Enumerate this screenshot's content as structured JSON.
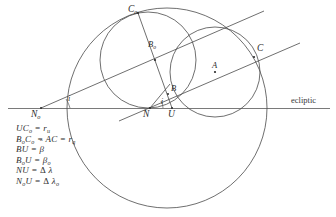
{
  "figure": {
    "type": "geometric-diagram",
    "background_color": "#ffffff",
    "stroke_color": "#3a3a3a"
  },
  "axis": {
    "ecliptic_label": "ecliptic"
  },
  "points": [
    {
      "key": "C_o",
      "text": "C",
      "sub": "o",
      "x": 138,
      "y": 13,
      "label_x": 128,
      "label_y": 6
    },
    {
      "key": "B_o",
      "text": "B",
      "sub": "o",
      "x": 155,
      "y": 50,
      "label_x": 149,
      "label_y": 41
    },
    {
      "key": "C",
      "text": "C",
      "sub": "",
      "x": 254,
      "y": 57,
      "label_x": 256,
      "label_y": 45
    },
    {
      "key": "A",
      "text": "A",
      "sub": "",
      "x": 215,
      "y": 72,
      "label_x": 213,
      "label_y": 62
    },
    {
      "key": "B",
      "text": "B",
      "sub": "",
      "x": 168,
      "y": 95,
      "label_x": 170,
      "label_y": 85
    },
    {
      "key": "N",
      "text": "N",
      "sub": "",
      "x": 150,
      "y": 108,
      "label_x": 144,
      "label_y": 110
    },
    {
      "key": "U",
      "text": "U",
      "sub": "",
      "x": 172,
      "y": 108,
      "label_x": 168,
      "label_y": 110
    },
    {
      "key": "N_o",
      "text": "N",
      "sub": "o",
      "x": 41,
      "y": 108,
      "label_x": 31,
      "label_y": 110
    }
  ],
  "angles": [
    {
      "key": "i-at-No",
      "text": "i",
      "label_x": 66,
      "label_y": 96
    },
    {
      "key": "i-at-N",
      "text": "i",
      "label_x": 162,
      "label_y": 98
    }
  ],
  "legend": {
    "equations": [
      {
        "id": "eq-1",
        "html": "UC<sub>o</sub> = r<sub>u</sub>"
      },
      {
        "id": "eq-2",
        "html": "B<sub>o</sub>C<sub>o</sub> = AC = r<sub>q</sub>"
      },
      {
        "id": "eq-3",
        "html": "BU = <span class=\"hat\">β</span>"
      },
      {
        "id": "eq-4",
        "html": "B<sub>o</sub>U = β<sub>o</sub>"
      },
      {
        "id": "eq-5",
        "html": "NU = <span class=\"up\">Δ</span> λ"
      },
      {
        "id": "eq-6",
        "html": "N<sub>o</sub>U = <span class=\"up\">Δ</span> λ<sub>o</sub>"
      }
    ],
    "plain_text": [
      "UC_o = r_u",
      "B_oC_o = AC = r_q",
      "BU = beta-hat",
      "B_oU = beta_o",
      "NU = delta-lambda",
      "N_oU = delta-lambda_o"
    ]
  },
  "geometry": {
    "ecliptic_line": {
      "x1": 8,
      "y1": 108,
      "x2": 330,
      "y2": 108
    },
    "circles": [
      {
        "name": "large-orbit-circle",
        "cx": 167,
        "cy": 108,
        "r": 100
      },
      {
        "name": "upper-left-circle",
        "cx": 148,
        "cy": 60,
        "r": 48
      },
      {
        "name": "right-circle",
        "cx": 215,
        "cy": 72,
        "r": 45
      }
    ],
    "inclined_lines": [
      {
        "name": "node-line-upper",
        "x1": 41,
        "y1": 108,
        "x2": 262,
        "y2": 12
      },
      {
        "name": "node-line-lower",
        "x1": 120,
        "y1": 118,
        "x2": 298,
        "y2": 45
      }
    ],
    "chords": [
      {
        "name": "chord-Co-U",
        "x1": 138,
        "y1": 13,
        "x2": 172,
        "y2": 108
      },
      {
        "name": "chord-N-B",
        "x1": 150,
        "y1": 108,
        "x2": 171,
        "y2": 84
      }
    ]
  }
}
